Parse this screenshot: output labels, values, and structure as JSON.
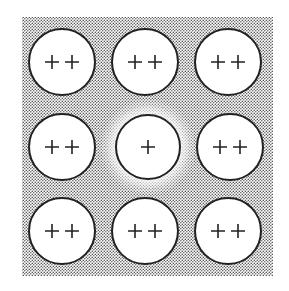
{
  "diagram": {
    "background_color": "#ffffff",
    "lattice_fill": "#c8c8c8",
    "lattice_bounds": {
      "x": 22,
      "y": 17,
      "width": 251,
      "height": 259
    },
    "ions": [
      {
        "row": 0,
        "col": 0,
        "cx": 62,
        "cy": 62,
        "r": 33,
        "label": "+ +",
        "charge": 2
      },
      {
        "row": 0,
        "col": 1,
        "cx": 145,
        "cy": 62,
        "r": 33,
        "label": "+ +",
        "charge": 2
      },
      {
        "row": 0,
        "col": 2,
        "cx": 228,
        "cy": 62,
        "r": 33,
        "label": "+ +",
        "charge": 2
      },
      {
        "row": 1,
        "col": 0,
        "cx": 62,
        "cy": 147,
        "r": 33,
        "label": "+ +",
        "charge": 2
      },
      {
        "row": 1,
        "col": 1,
        "cx": 148,
        "cy": 147,
        "r": 32,
        "label": "+",
        "charge": 1,
        "halo": true
      },
      {
        "row": 1,
        "col": 2,
        "cx": 230,
        "cy": 147,
        "r": 33,
        "label": "+ +",
        "charge": 2
      },
      {
        "row": 2,
        "col": 0,
        "cx": 62,
        "cy": 231,
        "r": 33,
        "label": "+ +",
        "charge": 2
      },
      {
        "row": 2,
        "col": 1,
        "cx": 145,
        "cy": 231,
        "r": 33,
        "label": "+ +",
        "charge": 2
      },
      {
        "row": 2,
        "col": 2,
        "cx": 228,
        "cy": 231,
        "r": 33,
        "label": "+ +",
        "charge": 2
      }
    ]
  }
}
